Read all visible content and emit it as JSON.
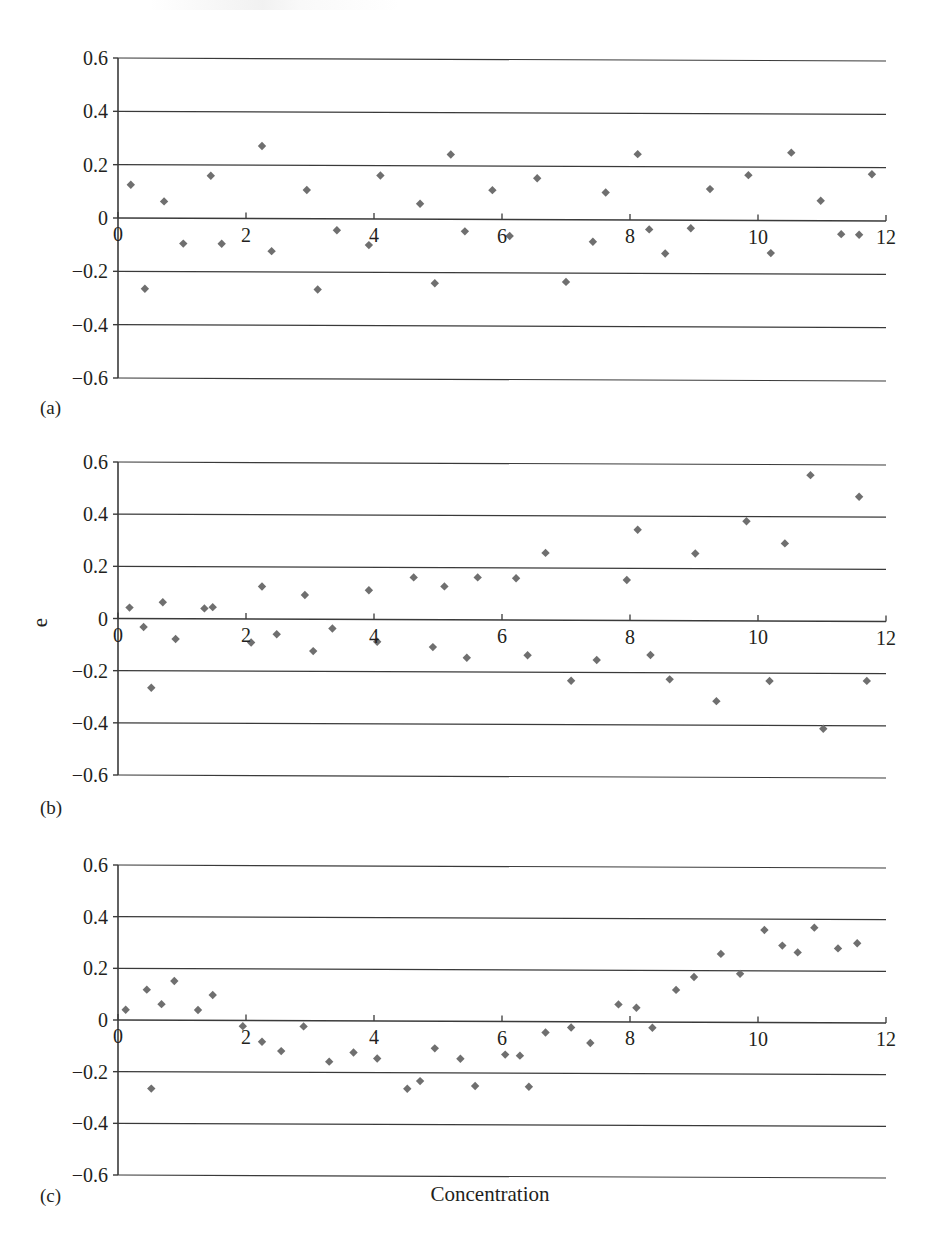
{
  "figure": {
    "axis_title_x": "Concentration",
    "axis_title_y": "e",
    "panel_captions": {
      "a": "(a)",
      "b": "(b)",
      "c": "(c)"
    },
    "marker_color": "#6f6f6f",
    "axis_color": "#3a3a3a",
    "text_color": "#231f20",
    "background": "#ffffff"
  },
  "chart_data": [
    {
      "id": "a",
      "type": "scatter",
      "title": "(a)",
      "xlabel": "",
      "ylabel": "",
      "xlim": [
        0,
        12
      ],
      "ylim": [
        -0.6,
        0.6
      ],
      "xticks": [
        0,
        2,
        4,
        6,
        8,
        10,
        12
      ],
      "xtick_labels": [
        "0",
        "2",
        "4",
        "6",
        "8",
        "10",
        "12"
      ],
      "yticks": [
        -0.6,
        -0.4,
        -0.2,
        0,
        0.2,
        0.4,
        0.6
      ],
      "ytick_labels": [
        "−0.6",
        "−0.4",
        "−0.2",
        "0",
        "0.2",
        "0.4",
        "0.6"
      ],
      "grid": "horizontal",
      "legend": "none",
      "marker": "diamond",
      "points": [
        [
          0.2,
          0.125
        ],
        [
          0.42,
          -0.265
        ],
        [
          0.72,
          0.063
        ],
        [
          1.02,
          -0.095
        ],
        [
          1.45,
          0.16
        ],
        [
          1.62,
          -0.095
        ],
        [
          2.25,
          0.272
        ],
        [
          2.4,
          -0.122
        ],
        [
          2.95,
          0.108
        ],
        [
          3.12,
          -0.265
        ],
        [
          3.42,
          -0.043
        ],
        [
          3.92,
          -0.098
        ],
        [
          4.1,
          0.163
        ],
        [
          4.72,
          0.058
        ],
        [
          4.95,
          -0.24
        ],
        [
          5.2,
          0.243
        ],
        [
          5.42,
          -0.045
        ],
        [
          5.85,
          0.11
        ],
        [
          6.12,
          -0.062
        ],
        [
          6.55,
          0.155
        ],
        [
          7.0,
          -0.233
        ],
        [
          7.42,
          -0.082
        ],
        [
          7.62,
          0.103
        ],
        [
          8.12,
          0.247
        ],
        [
          8.3,
          -0.035
        ],
        [
          8.55,
          -0.125
        ],
        [
          8.95,
          -0.03
        ],
        [
          9.25,
          0.117
        ],
        [
          9.85,
          0.17
        ],
        [
          10.2,
          -0.122
        ],
        [
          10.52,
          0.255
        ],
        [
          10.98,
          0.075
        ],
        [
          11.3,
          -0.05
        ],
        [
          11.58,
          -0.052
        ],
        [
          11.78,
          0.175
        ]
      ]
    },
    {
      "id": "b",
      "type": "scatter",
      "title": "(b)",
      "xlabel": "",
      "ylabel": "e",
      "xlim": [
        0,
        12
      ],
      "ylim": [
        -0.6,
        0.6
      ],
      "xticks": [
        0,
        2,
        4,
        6,
        8,
        10,
        12
      ],
      "xtick_labels": [
        "0",
        "2",
        "4",
        "6",
        "8",
        "10",
        "12"
      ],
      "yticks": [
        -0.6,
        -0.4,
        -0.2,
        0,
        0.2,
        0.4,
        0.6
      ],
      "ytick_labels": [
        "−0.6",
        "−0.4",
        "−0.2",
        "0",
        "0.2",
        "0.4",
        "0.6"
      ],
      "grid": "horizontal",
      "legend": "none",
      "marker": "diamond",
      "points": [
        [
          0.18,
          0.042
        ],
        [
          0.4,
          -0.032
        ],
        [
          0.52,
          -0.265
        ],
        [
          0.7,
          0.063
        ],
        [
          0.9,
          -0.078
        ],
        [
          1.35,
          0.04
        ],
        [
          1.48,
          0.045
        ],
        [
          2.08,
          -0.09
        ],
        [
          2.25,
          0.125
        ],
        [
          2.48,
          -0.058
        ],
        [
          2.92,
          0.093
        ],
        [
          3.05,
          -0.122
        ],
        [
          3.35,
          -0.035
        ],
        [
          3.92,
          0.112
        ],
        [
          4.05,
          -0.085
        ],
        [
          4.62,
          0.162
        ],
        [
          4.92,
          -0.105
        ],
        [
          5.1,
          0.128
        ],
        [
          5.45,
          -0.145
        ],
        [
          5.62,
          0.163
        ],
        [
          6.22,
          0.16
        ],
        [
          6.4,
          -0.135
        ],
        [
          6.68,
          0.258
        ],
        [
          7.08,
          -0.232
        ],
        [
          7.48,
          -0.152
        ],
        [
          7.95,
          0.155
        ],
        [
          8.12,
          0.348
        ],
        [
          8.32,
          -0.132
        ],
        [
          8.62,
          -0.225
        ],
        [
          9.02,
          0.258
        ],
        [
          9.35,
          -0.308
        ],
        [
          9.82,
          0.382
        ],
        [
          10.18,
          -0.23
        ],
        [
          10.42,
          0.298
        ],
        [
          10.82,
          0.56
        ],
        [
          11.02,
          -0.412
        ],
        [
          11.58,
          0.478
        ],
        [
          11.7,
          -0.228
        ]
      ]
    },
    {
      "id": "c",
      "type": "scatter",
      "title": "(c)",
      "xlabel": "Concentration",
      "ylabel": "",
      "xlim": [
        0,
        12
      ],
      "ylim": [
        -0.6,
        0.6
      ],
      "xticks": [
        0,
        2,
        4,
        6,
        8,
        10,
        12
      ],
      "xtick_labels": [
        "0",
        "2",
        "4",
        "6",
        "8",
        "10",
        "12"
      ],
      "yticks": [
        -0.6,
        -0.4,
        -0.2,
        0,
        0.2,
        0.4,
        0.6
      ],
      "ytick_labels": [
        "−0.6",
        "−0.4",
        "−0.2",
        "0",
        "0.2",
        "0.4",
        "0.6"
      ],
      "grid": "horizontal",
      "legend": "none",
      "marker": "diamond",
      "points": [
        [
          0.12,
          0.04
        ],
        [
          0.45,
          0.118
        ],
        [
          0.52,
          -0.265
        ],
        [
          0.68,
          0.062
        ],
        [
          0.88,
          0.152
        ],
        [
          1.25,
          0.04
        ],
        [
          1.48,
          0.098
        ],
        [
          1.95,
          -0.022
        ],
        [
          2.25,
          -0.082
        ],
        [
          2.55,
          -0.118
        ],
        [
          2.9,
          -0.022
        ],
        [
          3.3,
          -0.158
        ],
        [
          3.68,
          -0.122
        ],
        [
          4.05,
          -0.145
        ],
        [
          4.52,
          -0.262
        ],
        [
          4.72,
          -0.232
        ],
        [
          4.95,
          -0.105
        ],
        [
          5.35,
          -0.145
        ],
        [
          5.58,
          -0.25
        ],
        [
          6.05,
          -0.128
        ],
        [
          6.28,
          -0.132
        ],
        [
          6.42,
          -0.252
        ],
        [
          6.68,
          -0.042
        ],
        [
          7.08,
          -0.022
        ],
        [
          7.38,
          -0.082
        ],
        [
          7.82,
          0.068
        ],
        [
          8.1,
          0.055
        ],
        [
          8.35,
          -0.022
        ],
        [
          8.72,
          0.125
        ],
        [
          9.0,
          0.175
        ],
        [
          9.42,
          0.265
        ],
        [
          9.72,
          0.188
        ],
        [
          10.1,
          0.358
        ],
        [
          10.38,
          0.298
        ],
        [
          10.62,
          0.272
        ],
        [
          10.88,
          0.368
        ],
        [
          11.25,
          0.288
        ],
        [
          11.55,
          0.308
        ]
      ]
    }
  ]
}
